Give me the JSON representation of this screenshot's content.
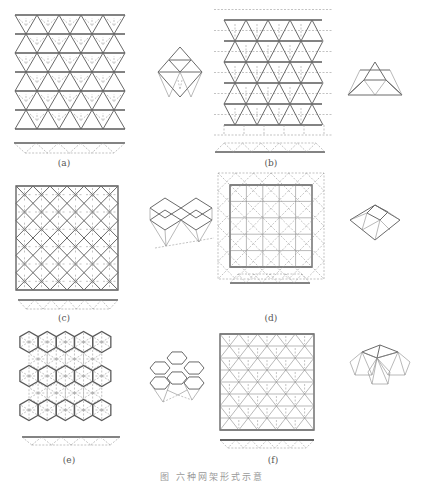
{
  "figure": {
    "caption": "图  六种网架形式示意",
    "panels": [
      {
        "id": "a",
        "label": "(a)",
        "grid": "triangular (inverted triangle cones)",
        "module": "tetrahedral pyramid unit"
      },
      {
        "id": "b",
        "label": "(b)",
        "grid": "triangular (offset dashed lower chords)",
        "module": "truncated triangular pyramid unit"
      },
      {
        "id": "c",
        "label": "(c)",
        "grid": "diagonal square (rotated 45°)",
        "module": "inverted square pyramid units"
      },
      {
        "id": "d",
        "label": "(d)",
        "grid": "orthogonal square with dashed diagonal lower chords",
        "module": "square pyramid unit"
      },
      {
        "id": "e",
        "label": "(e)",
        "grid": "hexagonal",
        "module": "inverted hexagonal pyramid units"
      },
      {
        "id": "f",
        "label": "(f)",
        "grid": "triangular-hexagonal",
        "module": "hexagonal pyramid cluster"
      }
    ]
  },
  "colors": {
    "line": "#6a6a6a",
    "dashed": "#9a9a9a",
    "background": "#ffffff"
  }
}
